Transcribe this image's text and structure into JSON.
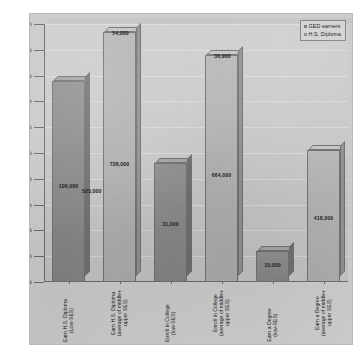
{
  "chart_data": {
    "type": "bar",
    "title": "",
    "xlabel": "",
    "ylabel": "",
    "ylim": [
      0,
      100
    ],
    "ytick_labels": [
      "100%",
      "90%",
      "80%",
      "70%",
      "60%",
      "50%",
      "40%",
      "30%",
      "20%",
      "10%",
      "0%"
    ],
    "ytick_values": [
      100,
      90,
      80,
      70,
      60,
      50,
      40,
      30,
      20,
      10,
      0
    ],
    "grid": true,
    "legend_position": "top-right",
    "legend": [
      "GED earners",
      "H.S. Diploma"
    ],
    "categories": [
      "Earn H.S. Diploma (Low-SES)",
      "Earn H.S. Diploma (average of middle+ upper SES)",
      "Enroll in College (low-SES)",
      "Enroll in College (average of middle+ upper SES)",
      "Earn a Degree (low-SES)",
      "Earn a Degree (average of middle+ upper SES)"
    ],
    "bars": [
      {
        "category": "Earn H.S. Diploma (Low-SES)",
        "series": "GED earners",
        "percent": 78,
        "label": "106,000"
      },
      {
        "category": "Earn H.S. Diploma (average of middle+ upper SES)",
        "series": "H.S. Diploma",
        "percent": 97,
        "label": "728,000",
        "top_label": "54,000"
      },
      {
        "category": "Enroll in College (low-SES)",
        "series": "GED earners",
        "percent": 46,
        "label": "31,000"
      },
      {
        "category": "Enroll in College (average of middle+ upper SES)",
        "series": "H.S. Diploma",
        "percent": 88,
        "label": "664,000",
        "top_label": "36,900"
      },
      {
        "category": "Earn a Degree (low-SES)",
        "series": "GED earners",
        "percent": 12,
        "label": "10,000"
      },
      {
        "category": "Earn a Degree (average of middle+ upper SES)",
        "series": "H.S. Diploma",
        "percent": 51,
        "label": "418,000"
      }
    ],
    "annotations": [
      {
        "text": "523,000",
        "note": "low-SES H.S. diploma count printed inside first tall bar region"
      }
    ],
    "colors": {
      "ged_earners": "#8a8a8a",
      "hs_diploma": "#b2b2b2",
      "plot_background": "#c9c9c9",
      "axis": "#6a6a6a",
      "text": "#1c1c1c"
    }
  }
}
